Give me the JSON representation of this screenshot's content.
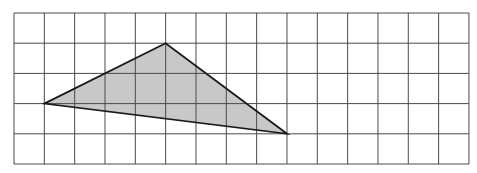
{
  "diagram": {
    "type": "grid-with-triangle",
    "grid": {
      "columns": 15,
      "rows": 5,
      "origin_x": 14,
      "origin_y": 13,
      "cell_width": 30.33,
      "cell_height": 30.2,
      "line_color": "#4a4a4a"
    },
    "triangle": {
      "vertices": [
        {
          "col": 1,
          "row": 3
        },
        {
          "col": 5,
          "row": 1
        },
        {
          "col": 9,
          "row": 4
        }
      ],
      "fill_color": "#c8c8c8",
      "stroke_color": "#1a1a1a"
    }
  }
}
